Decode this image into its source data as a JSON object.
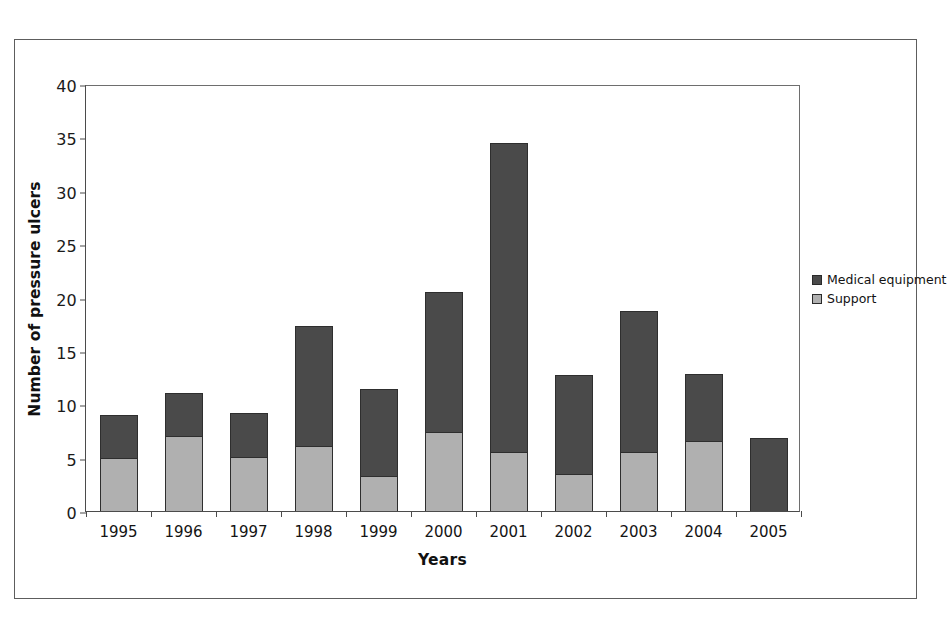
{
  "chart_data": {
    "type": "bar",
    "subtype": "stacked-bar",
    "title": "",
    "xlabel": "Years",
    "ylabel": "Number of pressure ulcers",
    "categories": [
      "1995",
      "1996",
      "1997",
      "1998",
      "1999",
      "2000",
      "2001",
      "2002",
      "2003",
      "2004",
      "2005"
    ],
    "series": [
      {
        "name": "Support",
        "color": "#b0b0b0",
        "values": [
          5.0,
          7.0,
          5.1,
          6.1,
          3.3,
          7.4,
          5.5,
          3.5,
          5.5,
          6.6,
          0
        ]
      },
      {
        "name": "Medical equipment",
        "color": "#4a4a4a",
        "values": [
          4.0,
          4.1,
          4.1,
          11.2,
          8.1,
          13.1,
          29.0,
          9.2,
          13.2,
          6.2,
          6.8
        ]
      }
    ],
    "totals": [
      9.0,
      11.1,
      9.2,
      17.3,
      11.4,
      20.5,
      34.5,
      12.7,
      18.7,
      12.8,
      6.8
    ],
    "ylim": [
      0,
      40
    ],
    "ytick_step": 5,
    "yticks": [
      "0",
      "5",
      "10",
      "15",
      "20",
      "25",
      "30",
      "35",
      "40"
    ],
    "grid": false,
    "legend_position": "right"
  },
  "legend": {
    "items": [
      {
        "label": "Medical equipment",
        "color": "#4a4a4a"
      },
      {
        "label": "Support",
        "color": "#b0b0b0"
      }
    ]
  },
  "axes": {
    "x_title": "Years",
    "y_title": "Number of pressure ulcers"
  }
}
